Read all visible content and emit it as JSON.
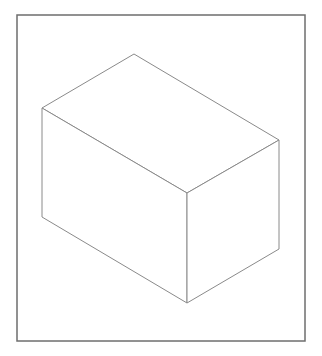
{
  "figure": {
    "background_color": "#ffffff",
    "frame": {
      "x": 17,
      "y": 15,
      "width": 288,
      "height": 326,
      "stroke_color": "#6e6e6e",
      "stroke_width": 1.5
    },
    "box": {
      "stroke_color": "#8a8a8a",
      "stroke_width": 1,
      "vertices": {
        "top": [
          134,
          54
        ],
        "left": [
          42,
          108
        ],
        "right": [
          279,
          140
        ],
        "front_top": [
          187,
          193
        ],
        "left_bottom": [
          42,
          217
        ],
        "right_bottom": [
          279,
          249
        ],
        "front_bottom": [
          187,
          303
        ]
      },
      "faces": {
        "top_face": "134,54 279,140 187,193 42,108",
        "left_face": "42,108 187,193 187,303 42,217",
        "right_face": "187,193 279,140 279,249 187,303"
      }
    }
  }
}
